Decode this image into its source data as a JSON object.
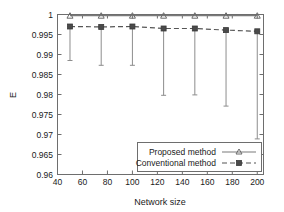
{
  "chart_data": {
    "type": "line",
    "title": "",
    "xlabel": "Network size",
    "ylabel": "E",
    "xlim": [
      40,
      205
    ],
    "ylim": [
      0.96,
      1.0
    ],
    "xticks": [
      40,
      60,
      80,
      100,
      120,
      140,
      160,
      180,
      200
    ],
    "yticks": [
      "0.96",
      "0.965",
      "0.97",
      "0.975",
      "0.98",
      "0.985",
      "0.99",
      "0.995",
      "1"
    ],
    "ytick_values": [
      0.96,
      0.965,
      0.97,
      0.975,
      0.98,
      0.985,
      0.99,
      0.995,
      1.0
    ],
    "grid": false,
    "legend_position": "bottom-right",
    "x": [
      50,
      75,
      100,
      125,
      150,
      175,
      200
    ],
    "series": [
      {
        "name": "Proposed method",
        "marker": "triangle",
        "linestyle": "solid",
        "values": [
          0.9997,
          0.9997,
          0.9997,
          0.9997,
          0.9997,
          0.9997,
          0.9997
        ],
        "errorbar_low": [
          0.9997,
          0.9997,
          0.9997,
          0.9997,
          0.9997,
          0.9997,
          0.9997
        ]
      },
      {
        "name": "Conventional method",
        "marker": "square",
        "linestyle": "dashed",
        "values": [
          0.997,
          0.9969,
          0.997,
          0.9965,
          0.9965,
          0.9961,
          0.9958
        ],
        "errorbar_low": [
          0.9885,
          0.9873,
          0.9873,
          0.9798,
          0.9799,
          0.9771,
          0.9689
        ]
      }
    ]
  },
  "legend": {
    "entries": [
      {
        "label": "Proposed method"
      },
      {
        "label": "Conventional method"
      }
    ]
  },
  "colors": {
    "axis": "#6e6e6e",
    "text": "#1a1a1a",
    "proposed": "#7a7a7a",
    "conventional": "#555555",
    "errorbar": "#8d8d8d",
    "background": "#ffffff"
  }
}
